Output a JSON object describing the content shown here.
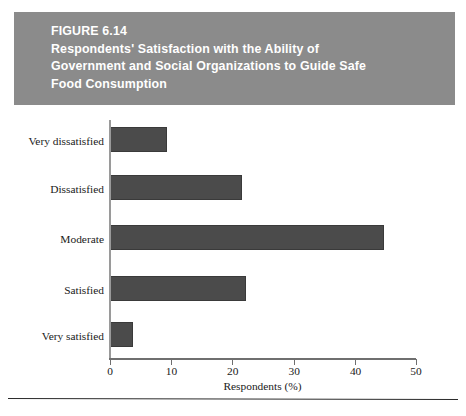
{
  "figure": {
    "number_label": "FIGURE 6.14",
    "title_lines": [
      "Respondents' Satisfaction with the Ability of",
      "Government and Social Organizations to Guide Safe",
      "Food Consumption"
    ],
    "header_bg": "#8b8b8b",
    "header_text_color": "#ffffff"
  },
  "chart_data": {
    "type": "bar",
    "orientation": "horizontal",
    "title": "Respondents' Satisfaction with the Ability of Government and Social Organizations to Guide Safe Food Consumption",
    "subtitle": "FIGURE 6.14",
    "categories": [
      "Very dissatisfied",
      "Dissatisfied",
      "Moderate",
      "Satisfied",
      "Very satisfied"
    ],
    "values": [
      9.3,
      21.6,
      44.8,
      22.3,
      3.8
    ],
    "xlabel": "Respondents (%)",
    "ylabel": "",
    "xlim": [
      0,
      50
    ],
    "xticks": [
      0,
      10,
      20,
      30,
      40,
      50
    ],
    "xtick_labels": [
      "0",
      "10",
      "20",
      "30",
      "40",
      "50"
    ],
    "grid": false,
    "legend": false,
    "bar_color": "#4b4b4b",
    "axis_color": "#6f6f6f"
  }
}
